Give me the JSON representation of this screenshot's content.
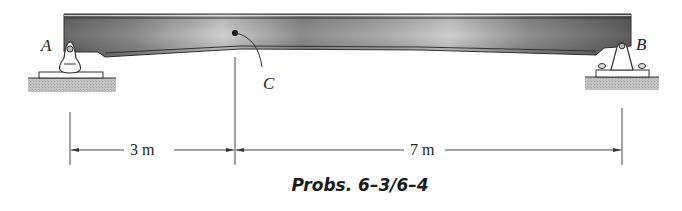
{
  "figure": {
    "caption": "Probs. 6–3/6–4",
    "points": {
      "A": "A",
      "B": "B",
      "C": "C"
    },
    "dimensions": [
      {
        "label": "3 m",
        "from": "A",
        "to": "C"
      },
      {
        "label": "7 m",
        "from": "C",
        "to": "B"
      }
    ],
    "supports": {
      "A": "pin",
      "B": "pin-bolted"
    },
    "colors": {
      "beam_dark": "#6e6e6e",
      "beam_light": "#d8d8d8",
      "ground": "#bdbdbd",
      "line": "#333333"
    }
  }
}
